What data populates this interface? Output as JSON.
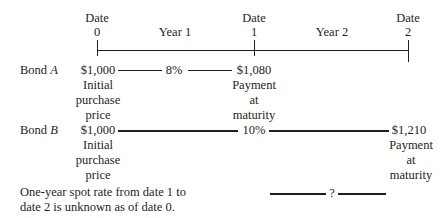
{
  "timeline": {
    "dates": [
      {
        "label": "Date",
        "value": "0"
      },
      {
        "label": "Date",
        "value": "1"
      },
      {
        "label": "Date",
        "value": "2"
      }
    ],
    "periods": [
      "Year 1",
      "Year 2"
    ]
  },
  "bond_a": {
    "name_prefix": "Bond ",
    "name_letter": "A",
    "price": "$1,000",
    "price_note": [
      "Initial",
      "purchase",
      "price"
    ],
    "rate": "8%",
    "payment": "$1,080",
    "payment_note": [
      "Payment",
      "at",
      "maturity"
    ]
  },
  "bond_b": {
    "name_prefix": "Bond ",
    "name_letter": "B",
    "price": "$1,000",
    "price_note": [
      "Initial",
      "purchase",
      "price"
    ],
    "rate": "10%",
    "payment": "$1,210",
    "payment_note": [
      "Payment",
      "at",
      "maturity"
    ]
  },
  "unknown_rate": {
    "note_line1": "One-year spot rate from date 1 to",
    "note_line2": "date 2 is unknown as of date 0.",
    "symbol": "?"
  }
}
